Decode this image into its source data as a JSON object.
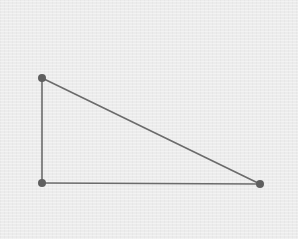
{
  "diagram": {
    "type": "right-triangle",
    "background_color": "#ececec",
    "stroke_color": "#6b6b6b",
    "vertex_color": "#5e5e5e",
    "stroke_width": 1.6,
    "vertex_radius": 4,
    "vertices": [
      {
        "id": "top-left",
        "x": 42,
        "y": 78
      },
      {
        "id": "bottom-left",
        "x": 42,
        "y": 183
      },
      {
        "id": "bottom-right",
        "x": 260,
        "y": 184
      }
    ],
    "edges": [
      {
        "id": "vertical-leg",
        "from": "top-left",
        "to": "bottom-left"
      },
      {
        "id": "horizontal-leg",
        "from": "bottom-left",
        "to": "bottom-right"
      },
      {
        "id": "hypotenuse",
        "from": "top-left",
        "to": "bottom-right"
      }
    ],
    "labels": []
  }
}
